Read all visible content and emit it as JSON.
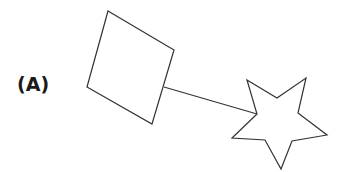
{
  "panel": {
    "label": "(A)"
  },
  "figure": {
    "stroke_color": "#333333",
    "fill_color": "#ffffff",
    "shapes": [
      {
        "type": "square",
        "points": "108,11 174,50 152,124 87,87"
      },
      {
        "type": "connector-line",
        "x1": 164,
        "y1": 87,
        "x2": 257,
        "y2": 114
      },
      {
        "type": "star",
        "points": "247,80 277,98 306,78 298,113 327,135 292,141 281,169 265,140 232,138 257,114"
      }
    ]
  }
}
